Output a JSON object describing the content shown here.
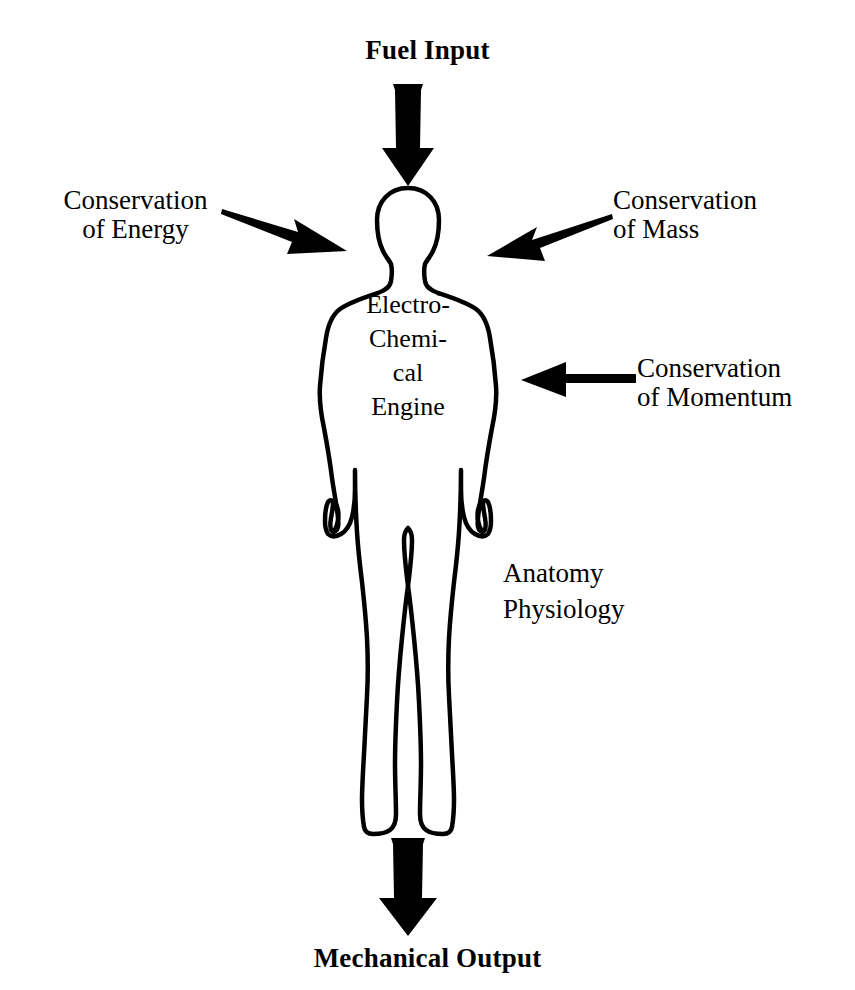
{
  "diagram": {
    "title_top": "Fuel Input",
    "title_bottom": "Mechanical Output",
    "body_label": "Electro-\nChemi-\ncal\nEngine",
    "labels": {
      "energy": "Conservation\nof Energy",
      "mass": "Conservation\nof Mass",
      "momentum": "Conservation\nof Momentum",
      "disciplines": "Anatomy\nPhysiology"
    },
    "colors": {
      "ink": "#000000",
      "background": "#ffffff"
    },
    "arrows": [
      {
        "name": "fuel-input-arrow",
        "direction": "down",
        "from": "Fuel Input",
        "to": "head"
      },
      {
        "name": "conservation-of-energy-arrow",
        "direction": "down-right",
        "from": "Conservation of Energy",
        "to": "upper-body-left"
      },
      {
        "name": "conservation-of-mass-arrow",
        "direction": "down-left",
        "from": "Conservation of Mass",
        "to": "upper-body-right"
      },
      {
        "name": "conservation-of-momentum-arrow",
        "direction": "left",
        "from": "Conservation of Momentum",
        "to": "torso-right"
      },
      {
        "name": "mechanical-output-arrow",
        "direction": "down",
        "from": "feet",
        "to": "Mechanical Output"
      }
    ],
    "figure": {
      "name": "human-body-outline",
      "stroke_width": 4,
      "fill": "none"
    }
  }
}
